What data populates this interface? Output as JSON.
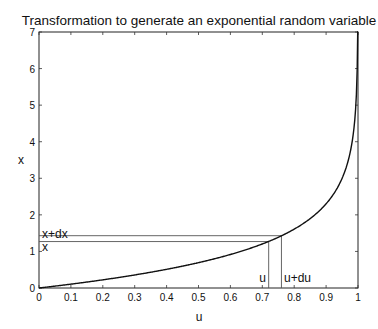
{
  "chart_data": {
    "type": "line",
    "title": "Transformation to generate an exponential random variable",
    "xlabel": "u",
    "ylabel": "x",
    "xlim": [
      0,
      1
    ],
    "ylim": [
      0,
      7
    ],
    "xticks": [
      0,
      0.1,
      0.2,
      0.3,
      0.4,
      0.5,
      0.6,
      0.7,
      0.8,
      0.9,
      1
    ],
    "xtick_labels": [
      "0",
      "0.1",
      "0.2",
      "0.3",
      "0.4",
      "0.5",
      "0.6",
      "0.7",
      "0.8",
      "0.9",
      "1"
    ],
    "yticks": [
      0,
      1,
      2,
      3,
      4,
      5,
      6,
      7
    ],
    "ytick_labels": [
      "0",
      "1",
      "2",
      "3",
      "4",
      "5",
      "6",
      "7"
    ],
    "grid": false,
    "legend": null,
    "series": [
      {
        "name": "x = -ln(1-u)",
        "function": "-ln(1-u)",
        "x": [
          0,
          0.1,
          0.2,
          0.3,
          0.4,
          0.5,
          0.6,
          0.7,
          0.8,
          0.9,
          0.95,
          0.98,
          0.99,
          0.999
        ],
        "y": [
          0,
          0.105,
          0.223,
          0.357,
          0.511,
          0.693,
          0.916,
          1.204,
          1.609,
          2.303,
          2.996,
          3.912,
          4.605,
          6.908
        ]
      }
    ],
    "annotations": [
      {
        "type": "vline",
        "label": "u",
        "x": 0.72,
        "y_top": 1.27
      },
      {
        "type": "vline",
        "label": "u+du",
        "x": 0.76,
        "y_top": 1.43
      },
      {
        "type": "hline",
        "label": "x",
        "y": 1.27,
        "x_right": 0.72
      },
      {
        "type": "hline",
        "label": "x+dx",
        "y": 1.43,
        "x_right": 0.76
      }
    ]
  },
  "labels": {
    "title": "Transformation to generate an exponential random variable",
    "xlabel": "u",
    "ylabel": "x",
    "ann_u": "u",
    "ann_udu": "u+du",
    "ann_x": "x",
    "ann_xdx": "x+dx"
  }
}
